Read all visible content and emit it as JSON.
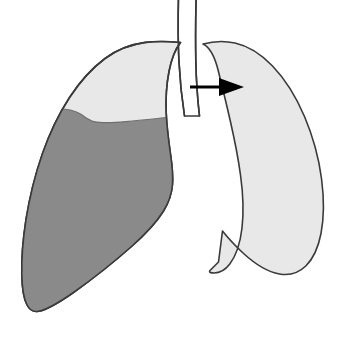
{
  "figure": {
    "width": 352,
    "height": 337,
    "background_color": "#ffffff"
  },
  "colors": {
    "background": "#ffffff",
    "aerated_lung_fill": "#e8e8e8",
    "effusion_fill": "#8a8a8a",
    "outline_stroke": "#3a3a3a",
    "airway_fill": "#ffffff",
    "arrow_color": "#000000"
  },
  "parts": [
    {
      "id": "left-lung",
      "label": "Lung with pleural effusion",
      "side": "viewer-left",
      "fill": "#e8e8e8",
      "outline": "#3a3a3a"
    },
    {
      "id": "effusion",
      "label": "Pleural effusion (fluid layer)",
      "fill": "#8a8a8a",
      "outline": "#3a3a3a",
      "meniscus": "curved fluid level, higher laterally"
    },
    {
      "id": "right-lung",
      "label": "Contralateral lung",
      "side": "viewer-right",
      "fill": "#e8e8e8",
      "outline": "#3a3a3a"
    },
    {
      "id": "trachea",
      "label": "Trachea / mediastinal airway",
      "fill": "#ffffff",
      "outline": "#3a3a3a"
    },
    {
      "id": "shift-arrow",
      "label": "Mediastinal shift direction",
      "color": "#000000",
      "direction": "right",
      "start_x": 190,
      "end_x": 244,
      "y": 87
    }
  ],
  "arrow": {
    "color": "#000000",
    "shaft_start_x": 190,
    "shaft_end_x": 222,
    "shaft_y": 87,
    "shaft_thickness": 3,
    "head_tip_x": 244,
    "head_back_x": 219,
    "head_half_height": 9
  },
  "accessibility": {
    "alt_text": "Line drawing of two lungs. The viewer-left lung contains a large dark gray pleural effusion filling the lower two thirds with a curved meniscus; the viewer-right lung is uniformly light gray. A black arrow between them points to the right, indicating mediastinal shift away from the effusion."
  }
}
